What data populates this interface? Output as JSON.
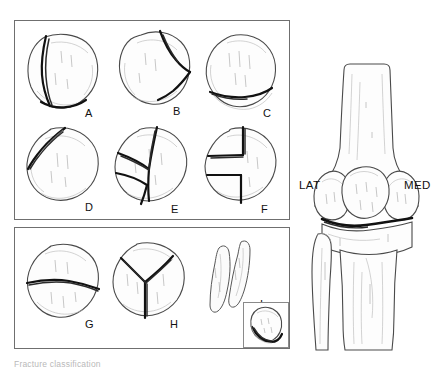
{
  "figure": {
    "caption": "Fracture classification",
    "panels": [
      {
        "id": "panel-top",
        "name": "undisplaced-fractures-panel"
      },
      {
        "id": "panel-bottom",
        "name": "displaced-fractures-panel"
      }
    ]
  },
  "fracture_patterns": [
    {
      "label": "A",
      "name": "vertical-marginal-fracture",
      "description": "Vertical fracture line, lateral margin"
    },
    {
      "label": "B",
      "name": "oblique-upper-pole-fracture",
      "description": "Oblique fracture of superolateral pole"
    },
    {
      "label": "C",
      "name": "lower-pole-transverse-fracture",
      "description": "Transverse fracture of inferior pole"
    },
    {
      "label": "D",
      "name": "superomedial-oblique-fracture",
      "description": "Oblique fracture superomedial corner"
    },
    {
      "label": "E",
      "name": "comminuted-stellate-fracture",
      "description": "Comminuted multi-fragment fracture"
    },
    {
      "label": "F",
      "name": "step-z-shaped-fracture",
      "description": "Step / Z shaped vertical fracture"
    },
    {
      "label": "G",
      "name": "transverse-midbody-fracture",
      "description": "Transverse fracture through mid body"
    },
    {
      "label": "H",
      "name": "y-shaped-three-part-fracture",
      "description": "Y shaped three part fracture"
    },
    {
      "label": "I",
      "name": "displaced-vertical-split",
      "description": "Displaced vertical split, two fragments"
    }
  ],
  "knee": {
    "name": "anterior-knee-anatomy",
    "lateral_label": "LAT",
    "medial_label": "MED"
  },
  "inset": {
    "name": "axial-patella-view",
    "description": "Axial (sunrise) view of patella"
  },
  "colors": {
    "outline": "#4a4a4a",
    "fracture": "#111111",
    "panel_border": "#6f6f6f",
    "background": "#ffffff"
  }
}
